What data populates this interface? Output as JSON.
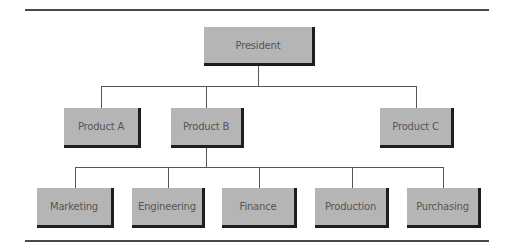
{
  "diagram": {
    "type": "org-chart",
    "root": {
      "label": "President",
      "children": [
        {
          "label": "Product A",
          "children": []
        },
        {
          "label": "Product B",
          "children": [
            {
              "label": "Marketing"
            },
            {
              "label": "Engineering"
            },
            {
              "label": "Finance"
            },
            {
              "label": "Production"
            },
            {
              "label": "Purchasing"
            }
          ]
        },
        {
          "label": "Product C",
          "children": []
        }
      ]
    }
  },
  "nodes": {
    "president": "President",
    "product_a": "Product A",
    "product_b": "Product B",
    "product_c": "Product C",
    "marketing": "Marketing",
    "engineering": "Engineering",
    "finance": "Finance",
    "production": "Production",
    "purchasing": "Purchasing"
  },
  "colors": {
    "box_fill": "#b5b5b5",
    "box_shadow": "#1e1e1e",
    "connector": "#555555",
    "text": "#555555",
    "rule": "#4a4a4a"
  }
}
